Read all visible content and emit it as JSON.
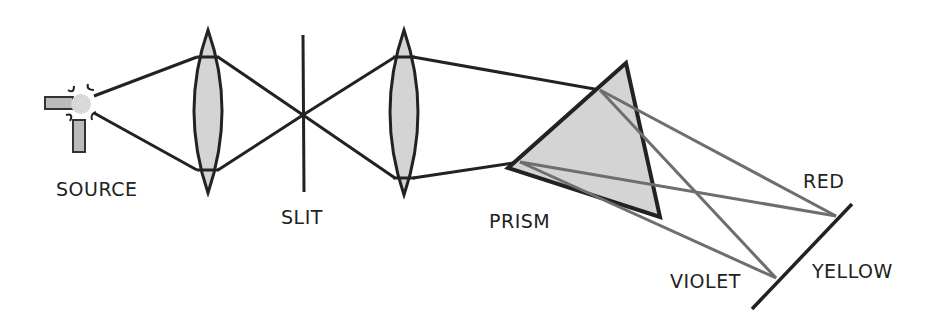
{
  "diagram": {
    "type": "optics-spectroscope",
    "labels": {
      "source": "SOURCE",
      "slit": "SLIT",
      "prism": "PRISM",
      "red": "RED",
      "yellow": "YELLOW",
      "violet": "VIOLET"
    },
    "colors": {
      "line": "#222222",
      "glass_fill": "#d4d4d4",
      "dispersed_ray": "#6e6e6e",
      "background": "#ffffff"
    },
    "components": [
      {
        "id": "source",
        "label": "SOURCE"
      },
      {
        "id": "collimating-lens",
        "label": ""
      },
      {
        "id": "slit",
        "label": "SLIT"
      },
      {
        "id": "focusing-lens",
        "label": ""
      },
      {
        "id": "prism",
        "label": "PRISM"
      },
      {
        "id": "screen",
        "label": ""
      }
    ],
    "spectrum_positions": [
      "RED",
      "YELLOW",
      "VIOLET"
    ]
  }
}
